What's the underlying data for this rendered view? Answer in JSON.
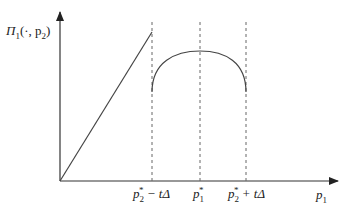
{
  "diagram": {
    "y_axis_label": {
      "symbol": "Π",
      "sub": "1",
      "args": "(·, p",
      "args_sub": "2",
      "close": ")"
    },
    "x_axis_label": {
      "symbol": "p",
      "sub": "1"
    },
    "ticks": [
      {
        "id": "left",
        "base": "p",
        "sub": "2",
        "sup": "*",
        "suffix": " − tΔ"
      },
      {
        "id": "mid",
        "base": "p",
        "sub": "1",
        "sup": "*",
        "suffix": ""
      },
      {
        "id": "right",
        "base": "p",
        "sub": "2",
        "sup": "*",
        "suffix": " + tΔ"
      }
    ],
    "colors": {
      "axis": "#333333",
      "curve": "#444444",
      "dashed": "#666666"
    }
  }
}
